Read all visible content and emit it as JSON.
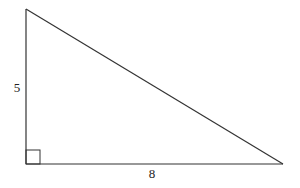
{
  "diagram": {
    "type": "right-triangle",
    "vertical_leg_label": "5",
    "horizontal_leg_label": "8",
    "right_angle_marker": true,
    "stroke_color": "#333333",
    "vertices": {
      "top": [
        26,
        9
      ],
      "right_angle": [
        26,
        164
      ],
      "right": [
        283,
        164
      ]
    }
  }
}
